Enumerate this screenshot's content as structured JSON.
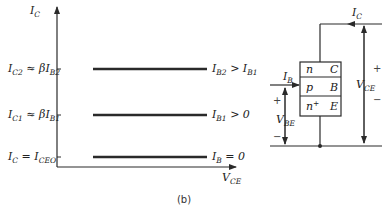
{
  "caption": "(b)",
  "graph": {
    "y_axis": {
      "name": "I",
      "sub": "C"
    },
    "x_axis": {
      "name": "V",
      "sub": "CE"
    },
    "curves": [
      {
        "left": [
          {
            "t": "I",
            "s": "C2"
          },
          {
            "t": " ≈ βI",
            "s": "B2"
          }
        ],
        "right": [
          {
            "t": "I",
            "s": "B2"
          },
          {
            "t": " > I",
            "s": "B1"
          }
        ]
      },
      {
        "left": [
          {
            "t": "I",
            "s": "C1"
          },
          {
            "t": " ≈ βI",
            "s": "B1"
          }
        ],
        "right": [
          {
            "t": "I",
            "s": "B1"
          },
          {
            "t": " > 0",
            "s": ""
          }
        ]
      },
      {
        "left": [
          {
            "t": "I",
            "s": "C"
          },
          {
            "t": " = I",
            "s": "CEO"
          }
        ],
        "right": [
          {
            "t": "I",
            "s": "B"
          },
          {
            "t": " = 0",
            "s": ""
          }
        ]
      }
    ]
  },
  "transistor": {
    "layers": [
      {
        "type": "n",
        "type_sup": "",
        "terminal": "C"
      },
      {
        "type": "p",
        "type_sup": "",
        "terminal": "B"
      },
      {
        "type": "n",
        "type_sup": "+",
        "terminal": "E"
      }
    ],
    "collector_current": {
      "name": "I",
      "sub": "C"
    },
    "base_current": {
      "name": "I",
      "sub": "B"
    },
    "vbe": {
      "name": "V",
      "sub": "BE",
      "plus": "+",
      "minus": "−"
    },
    "vce": {
      "name": "V",
      "sub": "CE",
      "plus": "+",
      "minus": "−"
    }
  }
}
